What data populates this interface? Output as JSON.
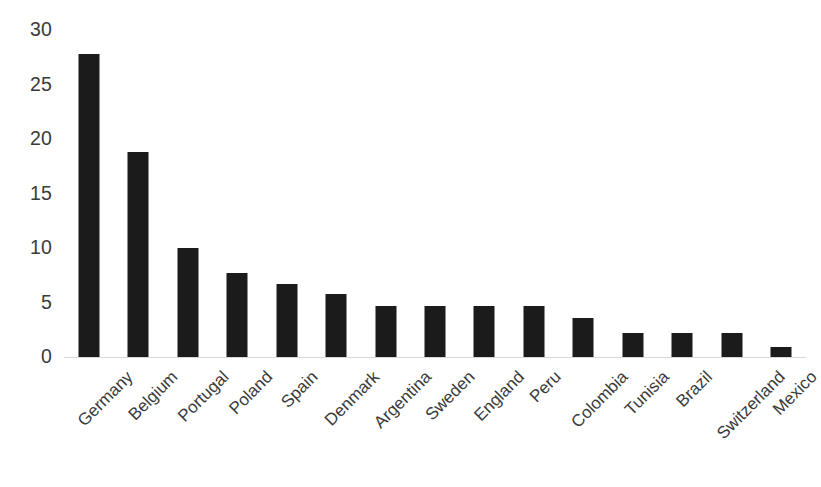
{
  "chart_data": {
    "type": "bar",
    "title": "",
    "subtitle": "",
    "xlabel": "",
    "ylabel": "",
    "categories": [
      "Germany",
      "Belgium",
      "Portugal",
      "Poland",
      "Spain",
      "Denmark",
      "Argentina",
      "Sweden",
      "England",
      "Peru",
      "Colombia",
      "Tunisia",
      "Brazil",
      "Switzerland",
      "Mexico"
    ],
    "values": [
      27.8,
      18.8,
      10.0,
      7.7,
      6.7,
      5.8,
      4.7,
      4.7,
      4.7,
      4.7,
      3.6,
      2.2,
      2.2,
      2.2,
      0.9
    ],
    "ylim": [
      0,
      30
    ],
    "yticks": [
      0,
      5,
      10,
      15,
      20,
      25,
      30
    ],
    "ytick_labels": [
      "0",
      "5",
      "10",
      "15",
      "20",
      "25",
      "30"
    ],
    "grid": false,
    "legend": "none",
    "bar_color": "#1b1b1b",
    "axis_color": "#d9d9d9",
    "tick_label_color": "#3a3a3a",
    "background_color": "#ffffff",
    "xtick_rotation_degrees": -45
  }
}
